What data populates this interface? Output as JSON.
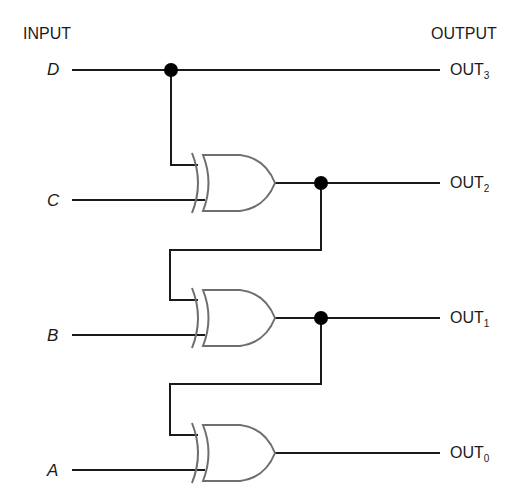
{
  "diagram": {
    "headers": {
      "input": "INPUT",
      "output": "OUTPUT"
    },
    "inputs": [
      {
        "name": "D",
        "y": 70
      },
      {
        "name": "C",
        "y": 200
      },
      {
        "name": "B",
        "y": 335
      },
      {
        "name": "A",
        "y": 470
      }
    ],
    "outputs": [
      {
        "base": "OUT",
        "sub": "3",
        "y": 70
      },
      {
        "base": "OUT",
        "sub": "2",
        "y": 183
      },
      {
        "base": "OUT",
        "sub": "1",
        "y": 318
      },
      {
        "base": "OUT",
        "sub": "0",
        "y": 453
      }
    ],
    "gates": [
      {
        "type": "XOR",
        "inputs": [
          "D",
          "C"
        ],
        "output": "OUT2"
      },
      {
        "type": "XOR",
        "inputs": [
          "OUT2",
          "B"
        ],
        "output": "OUT1"
      },
      {
        "type": "XOR",
        "inputs": [
          "OUT1",
          "A"
        ],
        "output": "OUT0"
      }
    ],
    "colors": {
      "wire": "#1a1a1a",
      "gate_outline": "#6e6e6e",
      "junction": "#000000"
    }
  }
}
